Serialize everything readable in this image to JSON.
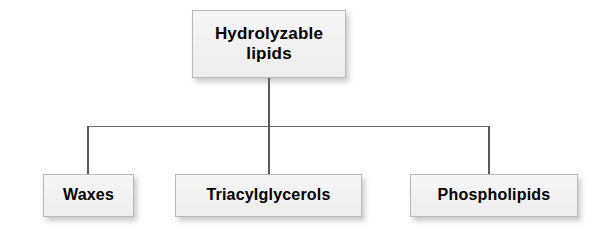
{
  "diagram": {
    "type": "hierarchy-tree",
    "background_color": "#ffffff",
    "node_fill_color": "#f1f1f1",
    "node_border_color": "#b8b8b8",
    "connector_color": "#5a5a5a",
    "text_color": "#000000",
    "root": {
      "label": "Hydrolyzable\nlipids"
    },
    "children": [
      {
        "label": "Waxes"
      },
      {
        "label": "Triacylglycerols"
      },
      {
        "label": "Phospholipids"
      }
    ]
  }
}
